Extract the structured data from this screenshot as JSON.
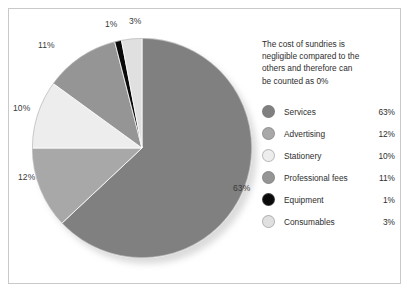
{
  "chart_data": {
    "type": "pie",
    "title": "",
    "categories": [
      "Services",
      "Advertising",
      "Stationery",
      "Professional fees",
      "Equipment",
      "Consumables"
    ],
    "values": [
      63,
      12,
      10,
      11,
      1,
      3
    ],
    "value_labels": [
      "63%",
      "12%",
      "10%",
      "11%",
      "1%",
      "3%"
    ],
    "colors": [
      "#808080",
      "#a8a8a8",
      "#ededed",
      "#959595",
      "#0a0a0a",
      "#e0e0e0"
    ],
    "start_angle_deg": 0,
    "direction": "clockwise",
    "legend_position": "right",
    "grid": false,
    "annotation": "The cost of sundries is negligible compared to the others and therefore can be counted as 0%"
  },
  "annotation": {
    "line1": "The cost of sundries is",
    "line2": "negligible compared to the",
    "line3": "others and therefore can",
    "line4": "be counted as 0%"
  },
  "legend": {
    "rows": [
      {
        "label": "Services",
        "value": "63%",
        "color": "#808080"
      },
      {
        "label": "Advertising",
        "value": "12%",
        "color": "#a8a8a8"
      },
      {
        "label": "Stationery",
        "value": "10%",
        "color": "#ededed"
      },
      {
        "label": "Professional fees",
        "value": "11%",
        "color": "#959595"
      },
      {
        "label": "Equipment",
        "value": "1%",
        "color": "#0a0a0a"
      },
      {
        "label": "Consumables",
        "value": "3%",
        "color": "#e0e0e0"
      }
    ]
  },
  "pie_labels": {
    "services": "63%",
    "advertising": "12%",
    "stationery": "10%",
    "professional_fees": "11%",
    "equipment": "1%",
    "consumables": "3%"
  }
}
